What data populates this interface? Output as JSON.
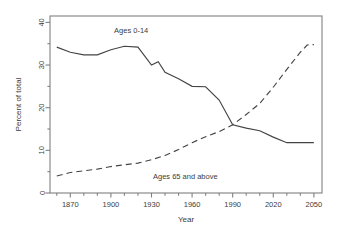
{
  "chart_data": {
    "type": "line",
    "title": "",
    "xlabel": "Year",
    "ylabel": "Percent of total",
    "xlim": [
      1855,
      2056
    ],
    "ylim": [
      0,
      41.5
    ],
    "grid": false,
    "legend_position": "inline-annotations",
    "xticks": [
      1870,
      1900,
      1930,
      1960,
      1990,
      2020,
      2050
    ],
    "xtick_labels": [
      "1870",
      "1900",
      "1930",
      "1960",
      "1990",
      "2020",
      "2050"
    ],
    "xminor_ticks": [
      1860,
      1880,
      1890,
      1910,
      1920,
      1940,
      1950,
      1970,
      1980,
      2000,
      2010,
      2030,
      2040
    ],
    "yticks": [
      0,
      10,
      20,
      30,
      40
    ],
    "ytick_labels": [
      "0",
      "10",
      "20",
      "30",
      "40"
    ],
    "yminor_ticks": [
      5,
      15,
      25,
      35
    ],
    "line_color": "#444444",
    "axis_color": "#808080",
    "background": "#ffffff",
    "series": [
      {
        "name": "Ages 0-14",
        "style": "solid",
        "label_x": 1915,
        "label_y": 37.4,
        "x": [
          1860,
          1870,
          1880,
          1890,
          1900,
          1910,
          1920,
          1930,
          1935,
          1940,
          1950,
          1960,
          1970,
          1980,
          1990,
          2000,
          2010,
          2020,
          2030,
          2040,
          2050
        ],
        "values": [
          34.2,
          33.0,
          32.4,
          32.4,
          33.6,
          34.4,
          34.2,
          30.0,
          30.8,
          28.3,
          26.8,
          25.0,
          24.9,
          21.8,
          16.0,
          15.2,
          14.6,
          13.1,
          11.8,
          11.8,
          11.8
        ]
      },
      {
        "name": "Ages 65 and above",
        "style": "dashed",
        "label_x": 1955,
        "label_y": 3.3,
        "x": [
          1860,
          1870,
          1880,
          1890,
          1900,
          1910,
          1920,
          1930,
          1940,
          1950,
          1960,
          1970,
          1980,
          1990,
          2000,
          2010,
          2020,
          2030,
          2040,
          2045,
          2050
        ],
        "values": [
          4.0,
          4.8,
          5.2,
          5.6,
          6.2,
          6.6,
          7.0,
          7.8,
          8.8,
          10.2,
          11.8,
          13.2,
          14.4,
          16.0,
          18.4,
          21.0,
          24.8,
          29.0,
          33.0,
          34.7,
          34.8
        ]
      }
    ]
  }
}
